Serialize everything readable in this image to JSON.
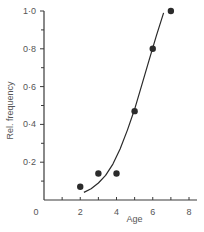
{
  "chart_data": {
    "type": "scatter",
    "title": "",
    "xlabel": "Age",
    "ylabel": "Rel. frequency",
    "xlim": [
      0,
      8
    ],
    "ylim": [
      0,
      1.0
    ],
    "x_ticks_major": [
      0,
      2,
      4,
      6,
      8
    ],
    "x_tick_labels": [
      "0",
      "2",
      "4",
      "6",
      "8"
    ],
    "x_ticks_minor": [
      1,
      3,
      5,
      7
    ],
    "y_ticks_major": [
      0.2,
      0.4,
      0.6,
      0.8,
      1.0
    ],
    "y_tick_labels": [
      "0·2",
      "0·4",
      "0·6",
      "0·8",
      "1·0"
    ],
    "y_ticks_minor": [
      0.1,
      0.3,
      0.5,
      0.7,
      0.9
    ],
    "grid": false,
    "legend": null,
    "series": [
      {
        "name": "observed",
        "kind": "scatter",
        "x": [
          2,
          3,
          4,
          5,
          6,
          7
        ],
        "y": [
          0.07,
          0.14,
          0.14,
          0.47,
          0.8,
          1.0
        ]
      },
      {
        "name": "fitted curve",
        "kind": "line",
        "x": [
          2.2,
          2.6,
          3.0,
          3.4,
          3.8,
          4.2,
          4.6,
          5.0,
          5.4,
          5.8,
          6.2,
          6.6
        ],
        "y": [
          0.04,
          0.06,
          0.09,
          0.13,
          0.19,
          0.27,
          0.37,
          0.48,
          0.61,
          0.74,
          0.87,
          0.99
        ]
      }
    ]
  }
}
